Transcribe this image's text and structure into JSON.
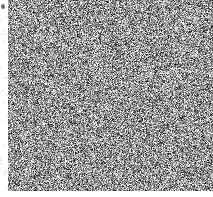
{
  "image": {
    "title": "grayscale random noise field",
    "kind": "noise-texture",
    "width": 213,
    "height": 197,
    "background_color": "#ffffff"
  },
  "noise_field": {
    "name": "random-grayscale-static",
    "x": 8,
    "y": 0,
    "width": 205,
    "height": 191,
    "cell_size": 1,
    "mean_gray": 150,
    "contrast": 105,
    "min_gray": 20,
    "max_gray": 255,
    "seed": 20250117,
    "color_mode": "grayscale",
    "description": "uniform salt-and-pepper pixel noise covering the full field with no discernible text, shapes, or structure"
  },
  "margins": {
    "left_margin_width": 8,
    "bottom_margin_height": 6,
    "margin_color": "#ffffff"
  },
  "corner_speck": {
    "name": "top-left-dark-speck",
    "x": 1,
    "y": 4,
    "width": 4,
    "height": 5,
    "color": "#6b6b6b"
  },
  "left_speckle": {
    "name": "left-margin-faint-speckle",
    "count": 26,
    "color": "#cfcfcf"
  }
}
